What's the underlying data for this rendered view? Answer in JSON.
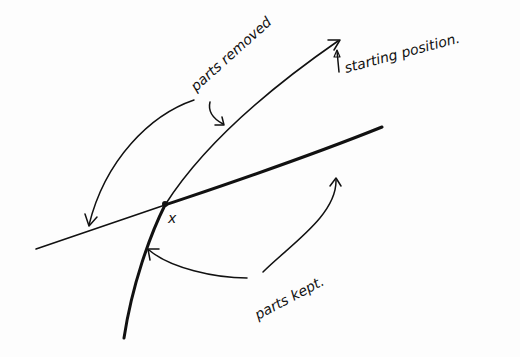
{
  "figure": {
    "type": "hand-drawn diagram",
    "labels": {
      "parts_removed": "parts removed",
      "starting_position": "starting position.",
      "parts_kept": "parts kept.",
      "intersection_point": "x"
    },
    "elements": [
      {
        "id": "line-a",
        "description": "straight line through x (thin on left, thick on right)"
      },
      {
        "id": "curve-b",
        "description": "curve through x; thin above (starting position, arrowhead at top end), thick below"
      },
      {
        "id": "arrows-removed",
        "description": "arrows from 'parts removed' to upper curve and left part of line"
      },
      {
        "id": "arrows-kept",
        "description": "arrows from 'parts kept.' to lower curve and right part of line"
      }
    ],
    "colors": {
      "ink": "#111111",
      "paper": "#fdfdfd",
      "bleed_through": "#ececec"
    }
  }
}
